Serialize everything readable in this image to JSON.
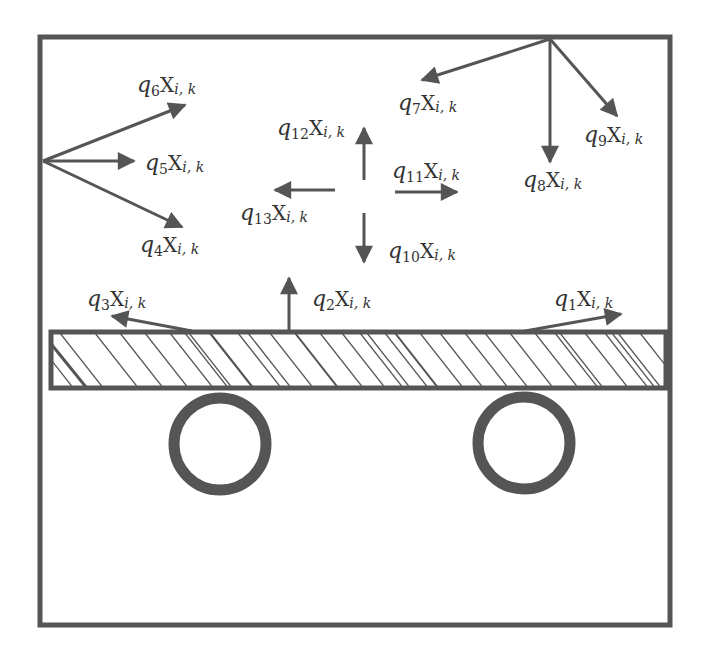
{
  "colors": {
    "stroke": "#555555",
    "label": "#333333",
    "background": "#ffffff"
  },
  "frame": {
    "x": 39,
    "y": 36,
    "width": 632,
    "height": 590
  },
  "beam": {
    "x": 50,
    "y": 331,
    "width": 617,
    "height": 58
  },
  "wheels": [
    {
      "name": "left-wheel",
      "cx": 220,
      "cy": 444,
      "r": 46
    },
    {
      "name": "right-wheel",
      "cx": 524,
      "cy": 443,
      "r": 46
    }
  ],
  "labels": {
    "q1": {
      "coef": "q",
      "index": "1",
      "var": "X",
      "sub": "i, k"
    },
    "q2": {
      "coef": "q",
      "index": "2",
      "var": "X",
      "sub": "i, k"
    },
    "q3": {
      "coef": "q",
      "index": "3",
      "var": "X",
      "sub": "i, k"
    },
    "q4": {
      "coef": "q",
      "index": "4",
      "var": "X",
      "sub": "i, k"
    },
    "q5": {
      "coef": "q",
      "index": "5",
      "var": "X",
      "sub": "i, k"
    },
    "q6": {
      "coef": "q",
      "index": "6",
      "var": "X",
      "sub": "i, k"
    },
    "q7": {
      "coef": "q",
      "index": "7",
      "var": "X",
      "sub": "i, k"
    },
    "q8": {
      "coef": "q",
      "index": "8",
      "var": "X",
      "sub": "i, k"
    },
    "q9": {
      "coef": "q",
      "index": "9",
      "var": "X",
      "sub": "i, k"
    },
    "q10": {
      "coef": "q",
      "index": "10",
      "var": "X",
      "sub": "i, k"
    },
    "q11": {
      "coef": "q",
      "index": "11",
      "var": "X",
      "sub": "i, k"
    },
    "q12": {
      "coef": "q",
      "index": "12",
      "var": "X",
      "sub": "i, k"
    },
    "q13": {
      "coef": "q",
      "index": "13",
      "var": "X",
      "sub": "i, k"
    }
  }
}
